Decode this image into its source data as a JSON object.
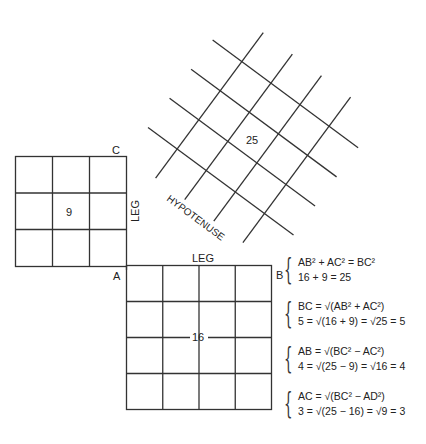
{
  "diagram": {
    "title_hidden": "",
    "points": {
      "A": {
        "label": "A",
        "x": 126,
        "y": 266
      },
      "B": {
        "label": "B",
        "x": 272,
        "y": 265
      },
      "C": {
        "label": "C",
        "x": 126,
        "y": 156
      }
    },
    "squares": [
      {
        "name": "leg-AC-square",
        "area_label": "9",
        "grid": 3
      },
      {
        "name": "leg-AB-square",
        "area_label": "16",
        "grid": 4
      },
      {
        "name": "hypotenuse-square",
        "area_label": "25",
        "grid": 5
      }
    ],
    "side_labels": {
      "leg_vertical": "LEG",
      "leg_horizontal": "LEG",
      "hypotenuse": "HYPOTENUSE"
    }
  },
  "equations": [
    {
      "line1": "AB² + AC² = BC²",
      "line2": "16 + 9 = 25"
    },
    {
      "line1": "BC = √(AB² + AC²)",
      "line2": "5 = √(16 + 9) = √25 = 5"
    },
    {
      "line1": "AB = √(BC² − AC²)",
      "line2": "4 = √(25 − 9) = √16 = 4"
    },
    {
      "line1": "AC = √(BC² − AD²)",
      "line2": "3 = √(25 − 16) = √9 = 3"
    }
  ]
}
